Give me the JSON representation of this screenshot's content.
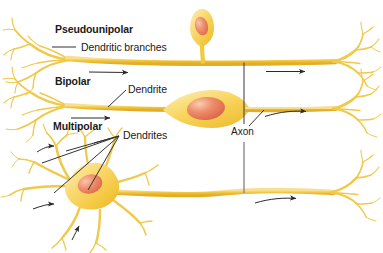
{
  "figure": {
    "background_color": "#ffffff",
    "width": 383,
    "height": 253
  },
  "palette": {
    "cytoplasm_light": "#FDE9A7",
    "cytoplasm_mid": "#F7D04A",
    "cytoplasm_deep": "#E8B52C",
    "process_stroke": "#EBC23F",
    "process_stroke_light": "#F4DC8C",
    "nucleus_light": "#F6BCA0",
    "nucleus_mid": "#E8795A",
    "nucleus_deep": "#D9604A",
    "leader_line": "#333333",
    "arrow": "#2b2b2b",
    "bracket": "#4a4a4a",
    "text": "#1a1a1a"
  },
  "labels": {
    "pseudounipolar": "Pseudounipolar",
    "dendritic_branches": "Dendritic branches",
    "bipolar": "Bipolar",
    "dendrite": "Dendrite",
    "multipolar": "Multipolar",
    "dendrites": "Dendrites",
    "axon": "Axon"
  },
  "rows": [
    {
      "id": "pseudounipolar",
      "name": "Pseudounipolar",
      "soma_shape": "teardrop-on-stalk",
      "soma_position": "above-axon-midline",
      "dendrite_side": "left",
      "terminal_side": "right",
      "flow_arrows": 2
    },
    {
      "id": "bipolar",
      "name": "Bipolar",
      "soma_shape": "fusiform-spindle",
      "soma_position": "inline-midline",
      "dendrite_side": "left",
      "terminal_side": "right",
      "flow_arrows": 2
    },
    {
      "id": "multipolar",
      "name": "Multipolar",
      "soma_shape": "stellate-polygonal",
      "soma_position": "inline-left",
      "dendrite_side": "radial",
      "terminal_side": "right",
      "flow_arrows": 3
    }
  ]
}
